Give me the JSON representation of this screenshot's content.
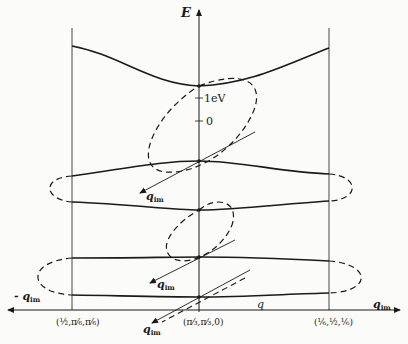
{
  "figure": {
    "type": "band-structure diagram with complex wavevector loops",
    "axes": {
      "vertical_label": "E",
      "horizontal_right_label": "q",
      "horizontal_right_sub": "im",
      "horizontal_left_label": "- q",
      "horizontal_left_sub": "im",
      "real_q_label": "q",
      "energy_ticks": [
        {
          "label": "1eV"
        },
        {
          "label": "0"
        }
      ]
    },
    "k_points": [
      {
        "name": "left",
        "label": "(½,π⁄₆,π⁄₆)"
      },
      {
        "name": "center",
        "label": "(π⁄₃,π⁄₃,0)"
      },
      {
        "name": "right",
        "label": "(⅙,½,⅙)"
      }
    ],
    "imaginary_axis_labels": [
      {
        "text": "q",
        "sub": "im"
      },
      {
        "text": "q",
        "sub": "im"
      },
      {
        "text": "q",
        "sub": "im"
      }
    ],
    "colors": {
      "line": "#1a1a1a",
      "background": "#fbfbf9"
    }
  }
}
